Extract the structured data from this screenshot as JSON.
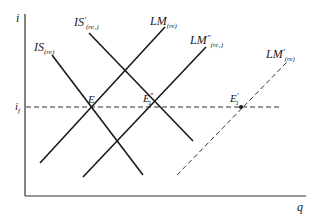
{
  "diagram": {
    "type": "IS-LM diagram",
    "axes": {
      "y_label": "i",
      "x_label": "q",
      "reference_level": {
        "label": "i",
        "subscript": "f"
      }
    },
    "curves": [
      {
        "id": "IS",
        "label": "IS",
        "prime": "",
        "subscript": "(re)",
        "style": "solid",
        "from": [
          52,
          55
        ],
        "to": [
          143,
          175
        ]
      },
      {
        "id": "IS_prime",
        "label": "IS",
        "prime": "′",
        "subscript": "(re₁)",
        "style": "solid",
        "from": [
          89,
          33
        ],
        "to": [
          193,
          141
        ]
      },
      {
        "id": "LM",
        "label": "LM",
        "prime": "",
        "subscript": "(re)",
        "style": "solid",
        "from": [
          40,
          163
        ],
        "to": [
          165,
          27
        ]
      },
      {
        "id": "LM_double_prime",
        "label": "LM",
        "prime": "″",
        "subscript": "(re₁)",
        "style": "solid",
        "from": [
          83,
          177
        ],
        "to": [
          206,
          47
        ]
      },
      {
        "id": "LM_prime",
        "label": "LM",
        "prime": "′",
        "subscript": "(re)",
        "style": "dashed",
        "from": [
          177,
          175
        ],
        "to": [
          287,
          62
        ]
      }
    ],
    "points": [
      {
        "id": "E",
        "label": "E",
        "prime": "",
        "subscript": ""
      },
      {
        "id": "E1_double_prime",
        "label": "E",
        "prime": "″",
        "subscript": "1"
      },
      {
        "id": "E1_prime",
        "label": "E",
        "prime": "′",
        "subscript": "1"
      }
    ],
    "colors": {
      "ink": "#1a1a1a",
      "background": "#ffffff"
    }
  }
}
